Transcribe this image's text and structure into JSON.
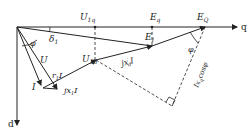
{
  "axes": {
    "q": "q",
    "d": "d"
  },
  "labels": {
    "U1q": "U",
    "U1q_sub": "1q",
    "U1d": "U",
    "U1d_sub": "1d",
    "Eq": "E",
    "Eq_sub": "q",
    "EQ": "E",
    "EQ_sub": "Q",
    "E1p": "E",
    "E1p_sub": "1",
    "E1p_sup": "′",
    "delta1": "δ",
    "delta1_sub": "1",
    "phi1": "φ",
    "phi2": "φ",
    "U": "U",
    "I": "I",
    "r1I": "r",
    "r1I_sub": "1",
    "r1I_tail": "I",
    "jx1I": "jx",
    "jx1I_sub": "1",
    "jx1I_tail": "I",
    "jxdI": "jx",
    "jxdI_sub": "d",
    "jxdI_sup": "′",
    "jxdI_tail": "I",
    "Ixcos": "Ix",
    "Ixcos_sub": "q",
    "Ixcos_tail": "cosφ"
  },
  "colors": {
    "line": "#222222",
    "background": "#ffffff"
  }
}
